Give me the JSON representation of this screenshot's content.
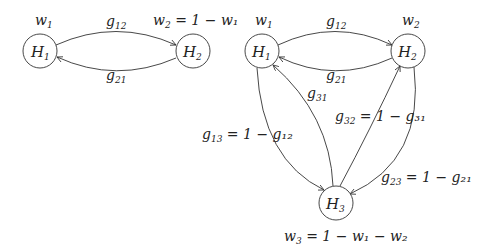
{
  "diagrams": [
    {
      "name": "two-state",
      "nodes": [
        {
          "id": "H1",
          "base": "H",
          "sub": "1",
          "weight": {
            "base": "w",
            "sub": "1",
            "rest": ""
          }
        },
        {
          "id": "H2",
          "base": "H",
          "sub": "2",
          "weight": {
            "base": "w",
            "sub": "2",
            "rest": " = 1 − w₁"
          }
        }
      ],
      "edges": [
        {
          "from": "H1",
          "to": "H2",
          "label": {
            "base": "g",
            "sub": "12",
            "rest": ""
          }
        },
        {
          "from": "H2",
          "to": "H1",
          "label": {
            "base": "g",
            "sub": "21",
            "rest": ""
          }
        }
      ]
    },
    {
      "name": "three-state",
      "nodes": [
        {
          "id": "H1",
          "base": "H",
          "sub": "1",
          "weight": {
            "base": "w",
            "sub": "1",
            "rest": ""
          }
        },
        {
          "id": "H2",
          "base": "H",
          "sub": "2",
          "weight": {
            "base": "w",
            "sub": "2",
            "rest": ""
          }
        },
        {
          "id": "H3",
          "base": "H",
          "sub": "3",
          "weight": {
            "base": "w",
            "sub": "3",
            "rest": " = 1 − w₁ − w₂"
          }
        }
      ],
      "edges": [
        {
          "from": "H1",
          "to": "H2",
          "label": {
            "base": "g",
            "sub": "12",
            "rest": ""
          }
        },
        {
          "from": "H2",
          "to": "H1",
          "label": {
            "base": "g",
            "sub": "21",
            "rest": ""
          }
        },
        {
          "from": "H3",
          "to": "H1",
          "label": {
            "base": "g",
            "sub": "31",
            "rest": ""
          }
        },
        {
          "from": "H3",
          "to": "H2",
          "label": {
            "base": "g",
            "sub": "32",
            "rest": " = 1 − g₃₁"
          }
        },
        {
          "from": "H1",
          "to": "H3",
          "label": {
            "base": "g",
            "sub": "13",
            "rest": " = 1 − g₁₂"
          }
        },
        {
          "from": "H2",
          "to": "H3",
          "label": {
            "base": "g",
            "sub": "23",
            "rest": " = 1 − g₂₁"
          }
        }
      ]
    }
  ]
}
